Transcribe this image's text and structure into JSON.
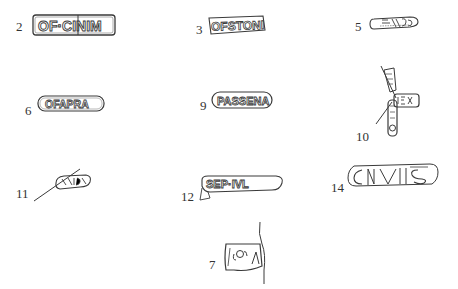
{
  "figure": {
    "type": "plate of drawn potter's stamps",
    "ink_color": "#3a3a3a",
    "background": "#ffffff"
  },
  "stamps": [
    {
      "label": "2",
      "reading": "OF·CINIM"
    },
    {
      "label": "3",
      "reading": "OFSTONI"
    },
    {
      "label": "5",
      "reading": ""
    },
    {
      "label": "6",
      "reading": "OFAPRA"
    },
    {
      "label": "9",
      "reading": "PASSENA"
    },
    {
      "label": "10",
      "reading": ""
    },
    {
      "label": "11",
      "reading": ""
    },
    {
      "label": "12",
      "reading": "SEP·IVL"
    },
    {
      "label": "14",
      "reading": "CIVIIS"
    },
    {
      "label": "7",
      "reading": ""
    }
  ]
}
